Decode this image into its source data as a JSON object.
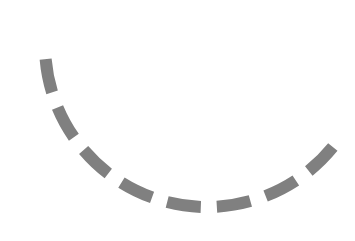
{
  "spinner": {
    "icon": "loading-spinner-icon",
    "color": "#808080",
    "stroke_width": 12,
    "dash": "34 16",
    "center_x": 207,
    "center_y": 45,
    "radius": 162,
    "start_angle_deg": 180,
    "end_angle_deg": 38
  }
}
